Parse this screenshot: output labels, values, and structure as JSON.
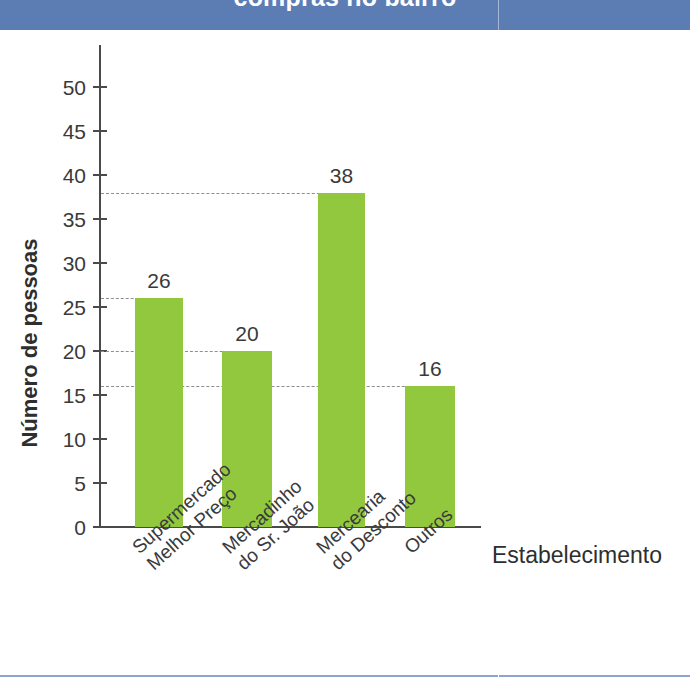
{
  "banner": {
    "title": "compras no bairro",
    "color": "#5c7cb4"
  },
  "chart_data": {
    "type": "bar",
    "title": "compras no bairro",
    "xlabel": "Estabelecimento",
    "ylabel": "Número de pessoas",
    "categories": [
      "Supermercado Melhor Preço",
      "Mercadinho do Sr. João",
      "Mercearia do Desconto",
      "Outros"
    ],
    "category_lines": [
      [
        "Supermercado",
        "Melhor Preço"
      ],
      [
        "Mercadinho",
        "do Sr. João"
      ],
      [
        "Mercearia",
        "do Desconto"
      ],
      [
        "Outros"
      ]
    ],
    "values": [
      26,
      20,
      38,
      16
    ],
    "value_labels": [
      "26",
      "20",
      "38",
      "16"
    ],
    "ylim": [
      0,
      52
    ],
    "yticks": [
      0,
      5,
      10,
      15,
      20,
      25,
      30,
      35,
      40,
      45,
      50
    ],
    "ytick_labels": [
      "0",
      "5",
      "10",
      "15",
      "20",
      "25",
      "30",
      "35",
      "40",
      "45",
      "50"
    ],
    "grid": false,
    "guide_lines": [
      38,
      26,
      20,
      16
    ],
    "legend": null,
    "bar_color": "#92c83e",
    "axis_color": "#4a4a4a",
    "guide_color": "#8e8e8e"
  }
}
